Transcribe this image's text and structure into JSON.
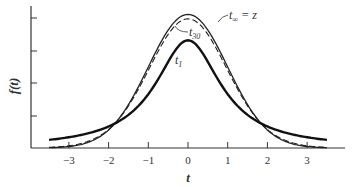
{
  "chart_data": {
    "type": "line",
    "title": "",
    "xlabel": "t",
    "ylabel": "f(t)",
    "xlim": [
      -3.6,
      3.6
    ],
    "xticks": [
      -3,
      -2,
      -1,
      0,
      1,
      2,
      3
    ],
    "xtick_labels": [
      "−3",
      "−2",
      "−1",
      "0",
      "1",
      "2",
      "3"
    ],
    "yticks_count": 4,
    "yticks_labeled": false,
    "grid": false,
    "legend": "inline annotations",
    "series": [
      {
        "name": "t∞ = z",
        "style": "thin solid",
        "description": "standard normal density",
        "peak": 0.399,
        "df": "∞"
      },
      {
        "name": "t30",
        "style": "dashed",
        "description": "Student t, 30 degrees of freedom",
        "peak": 0.396,
        "df": 30
      },
      {
        "name": "t1",
        "style": "thick solid",
        "description": "Student t, 1 degree of freedom (Cauchy)",
        "peak": 0.318,
        "df": 1
      }
    ],
    "annotations": [
      {
        "text": "t∞ = z",
        "points_to": "outer curve near peak right side"
      },
      {
        "text": "t30",
        "points_to": "dashed curve left of peak"
      },
      {
        "text": "t1",
        "points_to": "inner thick curve"
      }
    ]
  },
  "labels": {
    "ylabel": "f(t)",
    "xlabel": "t",
    "tinf_main": "t",
    "tinf_sub": "∞",
    "tinf_eq": " = z",
    "t30_main": "t",
    "t30_sub": "30",
    "t1_main": "t",
    "t1_sub": "1"
  }
}
